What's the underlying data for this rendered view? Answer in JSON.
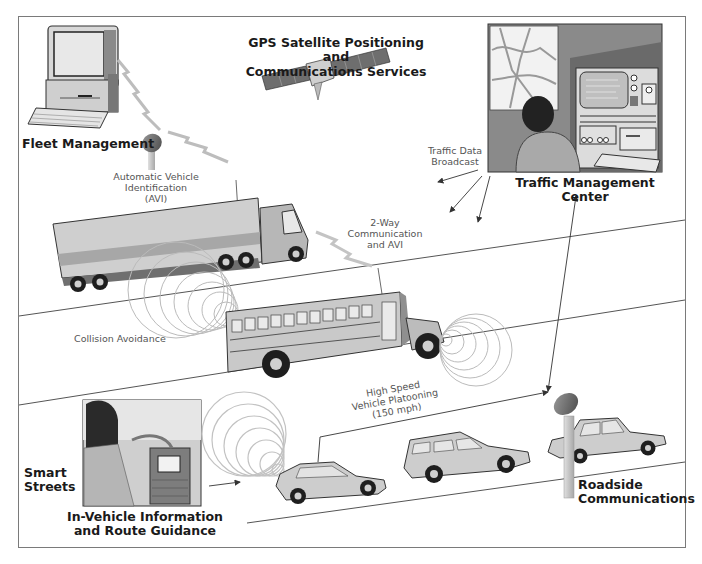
{
  "diagram": {
    "type": "intelligent-transportation-system-illustration",
    "colors": {
      "frame": "#7a7a7a",
      "road_line": "#555555",
      "vehicle_body": "#c8c8c8",
      "tire": "#1e1e1e",
      "signal_wave": "#b5b5b5",
      "label_bold": "#1a1a1a",
      "label_thin": "#555555"
    }
  },
  "labels": {
    "fleet_management": "Fleet Management",
    "gps_line1": "GPS Satellite Positioning and",
    "gps_line2": "Communications Services",
    "traffic_center": "Traffic Management Center",
    "traffic_data_line1": "Traffic Data",
    "traffic_data_line2": "Broadcast",
    "avi_line1": "Automatic Vehicle",
    "avi_line2": "Identification",
    "avi_line3": "(AVI)",
    "two_way_line1": "2-Way",
    "two_way_line2": "Communication",
    "two_way_line3": "and AVI",
    "collision": "Collision Avoidance",
    "platoon_line1": "High Speed",
    "platoon_line2": "Vehicle Platooning",
    "platoon_line3": "(150 mph)",
    "smart_line1": "Smart",
    "smart_line2": "Streets",
    "invehicle_line1": "In-Vehicle Information",
    "invehicle_line2": "and Route Guidance",
    "roadside_line1": "Roadside",
    "roadside_line2": "Communications"
  },
  "nodes": [
    {
      "id": "fleet-computer",
      "label": "Fleet Management"
    },
    {
      "id": "gps-satellite",
      "label": "GPS Satellite Positioning and Communications Services"
    },
    {
      "id": "traffic-center",
      "label": "Traffic Management Center"
    },
    {
      "id": "avi-antenna",
      "label": "Automatic Vehicle Identification (AVI)"
    },
    {
      "id": "truck",
      "label": "Truck"
    },
    {
      "id": "school-bus",
      "label": "School bus"
    },
    {
      "id": "in-vehicle-panel",
      "label": "In-Vehicle Information and Route Guidance"
    },
    {
      "id": "sedan",
      "label": "Sedan"
    },
    {
      "id": "suv",
      "label": "SUV"
    },
    {
      "id": "roadside-car",
      "label": "Car"
    },
    {
      "id": "roadside-dish",
      "label": "Roadside Communications"
    }
  ],
  "edges": [
    {
      "from": "fleet-computer",
      "to": "avi-antenna",
      "style": "lightning"
    },
    {
      "from": "avi-antenna",
      "to": "truck",
      "style": "lightning"
    },
    {
      "from": "truck",
      "to": "school-bus",
      "label": "2-Way Communication and AVI",
      "style": "lightning"
    },
    {
      "from": "traffic-center",
      "to": "road",
      "label": "Traffic Data Broadcast",
      "style": "arrows"
    },
    {
      "from": "traffic-center",
      "to": "roadside-dish",
      "style": "double-arrow"
    },
    {
      "from": "roadside-dish",
      "to": "sedan",
      "label": "High Speed Vehicle Platooning (150 mph)",
      "style": "arrow"
    },
    {
      "from": "in-vehicle-panel",
      "to": "sedan",
      "style": "arrow"
    },
    {
      "from": "truck",
      "to": "school-bus",
      "label": "Collision Avoidance",
      "style": "waves"
    }
  ]
}
